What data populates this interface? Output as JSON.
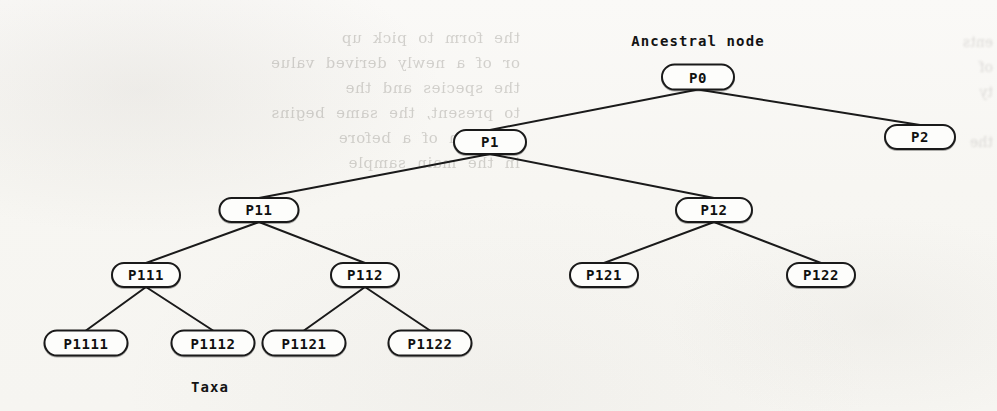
{
  "diagram": {
    "type": "phylogenetic-tree",
    "title_label": "Ancestral node",
    "bottom_label": "Taxa",
    "background_color": "#f8f7f4",
    "node_border_color": "#1a1a1a",
    "node_fill_color": "#fdfdfb",
    "edge_color": "#1a1a1a",
    "bleed_through_text": "the  form  to  pick  up\nor  of  a  newly  derived  value\nthe  species  and  the\nto  present,  the  same  begins\ntradition  of  a  before\nin  the  main  sample",
    "bleed_through_text_right": "ents\nof\nty\n\nthe"
  },
  "nodes": [
    {
      "id": "P0",
      "label": "P0",
      "x": 698,
      "y": 77,
      "w": 74,
      "h": 27,
      "level": 0,
      "role": "root"
    },
    {
      "id": "P1",
      "label": "P1",
      "x": 490,
      "y": 142,
      "w": 74,
      "h": 26,
      "level": 1,
      "role": "internal"
    },
    {
      "id": "P2",
      "label": "P2",
      "x": 920,
      "y": 137,
      "w": 72,
      "h": 26,
      "level": 1,
      "role": "internal"
    },
    {
      "id": "P11",
      "label": "P11",
      "x": 259,
      "y": 210,
      "w": 81,
      "h": 26,
      "level": 2,
      "role": "internal"
    },
    {
      "id": "P12",
      "label": "P12",
      "x": 714,
      "y": 210,
      "w": 78,
      "h": 26,
      "level": 2,
      "role": "internal"
    },
    {
      "id": "P111",
      "label": "P111",
      "x": 146,
      "y": 275,
      "w": 70,
      "h": 26,
      "level": 3,
      "role": "internal"
    },
    {
      "id": "P112",
      "label": "P112",
      "x": 365,
      "y": 275,
      "w": 70,
      "h": 26,
      "level": 3,
      "role": "internal"
    },
    {
      "id": "P121",
      "label": "P121",
      "x": 604,
      "y": 275,
      "w": 70,
      "h": 26,
      "level": 3,
      "role": "leaf"
    },
    {
      "id": "P122",
      "label": "P122",
      "x": 821,
      "y": 275,
      "w": 70,
      "h": 26,
      "level": 3,
      "role": "leaf"
    },
    {
      "id": "P1111",
      "label": "P1111",
      "x": 86,
      "y": 343,
      "w": 85,
      "h": 27,
      "level": 4,
      "role": "leaf"
    },
    {
      "id": "P1112",
      "label": "P1112",
      "x": 213,
      "y": 343,
      "w": 85,
      "h": 27,
      "level": 4,
      "role": "leaf"
    },
    {
      "id": "P1121",
      "label": "P1121",
      "x": 304,
      "y": 343,
      "w": 85,
      "h": 27,
      "level": 4,
      "role": "leaf"
    },
    {
      "id": "P1122",
      "label": "P1122",
      "x": 430,
      "y": 343,
      "w": 85,
      "h": 27,
      "level": 4,
      "role": "leaf"
    }
  ],
  "edges": [
    {
      "from": "P0",
      "to": "P1"
    },
    {
      "from": "P0",
      "to": "P2"
    },
    {
      "from": "P1",
      "to": "P11"
    },
    {
      "from": "P1",
      "to": "P12"
    },
    {
      "from": "P11",
      "to": "P111"
    },
    {
      "from": "P11",
      "to": "P112"
    },
    {
      "from": "P12",
      "to": "P121"
    },
    {
      "from": "P12",
      "to": "P122"
    },
    {
      "from": "P111",
      "to": "P1111"
    },
    {
      "from": "P111",
      "to": "P1112"
    },
    {
      "from": "P112",
      "to": "P1121"
    },
    {
      "from": "P112",
      "to": "P1122"
    }
  ],
  "annotations": [
    {
      "id": "ancestral-node-label",
      "text": "Ancestral node",
      "x": 698,
      "y": 41
    },
    {
      "id": "taxa-label",
      "text": "Taxa",
      "x": 210,
      "y": 387
    }
  ]
}
